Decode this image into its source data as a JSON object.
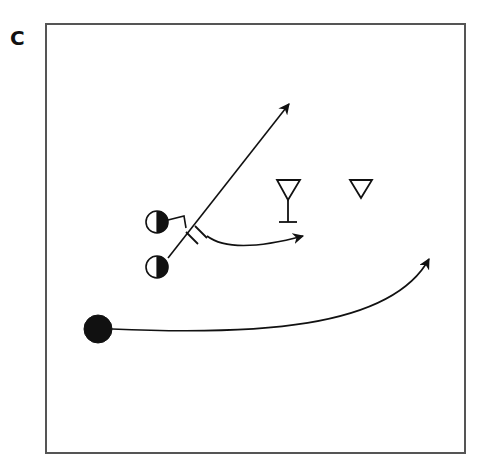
{
  "panel": {
    "label": "C"
  },
  "diagram": {
    "frame": {
      "x": 46,
      "y": 24,
      "width": 419,
      "height": 429,
      "stroke": "#555555"
    },
    "ink_color": "#111111",
    "players": [
      {
        "id": "offense-1",
        "type": "half-filled-circle",
        "cx": 157,
        "cy": 222,
        "r": 11
      },
      {
        "id": "offense-2",
        "type": "half-filled-circle",
        "cx": 157,
        "cy": 267,
        "r": 11
      },
      {
        "id": "ball-carrier",
        "type": "solid-circle",
        "cx": 98,
        "cy": 329,
        "r": 14
      }
    ],
    "defenders": [
      {
        "id": "defender-with-stem",
        "type": "triangle-down-stem",
        "points": "277,180 300,180 288,200",
        "stem_bottom": 222,
        "base_x1": 279,
        "base_x2": 297
      },
      {
        "id": "defender-2",
        "type": "triangle-down",
        "points": "350,180 372,180 361,198"
      }
    ],
    "paths": [
      {
        "id": "route-diagonal",
        "d": "M168,258 L289,104",
        "arrow": true
      },
      {
        "id": "route-short-curve",
        "d": "M207,236 Q232,255 303,236",
        "arrow": true
      },
      {
        "id": "route-long-curve",
        "d": "M112,329 C250,335 390,330 429,259",
        "arrow": true
      },
      {
        "id": "screen-connector",
        "d": "M168,220 L184,216 L186,228",
        "arrow": false
      }
    ],
    "screen_marks": [
      {
        "id": "screen-mark-1",
        "d": "M186,232 L198,244"
      },
      {
        "id": "screen-mark-2",
        "d": "M195,226 L207,238"
      }
    ]
  }
}
